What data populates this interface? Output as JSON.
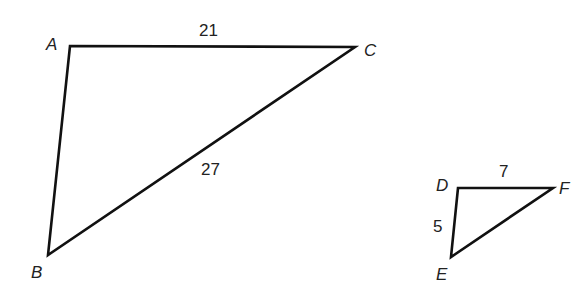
{
  "diagram": {
    "type": "similar-triangles",
    "triangles": [
      {
        "name": "ABC",
        "vertices": [
          {
            "label": "A",
            "x": 70,
            "y": 46,
            "lx": 46,
            "ly": 50
          },
          {
            "label": "B",
            "x": 48,
            "y": 255,
            "lx": 31,
            "ly": 278
          },
          {
            "label": "C",
            "x": 355,
            "y": 47,
            "lx": 364,
            "ly": 56
          }
        ],
        "side_labels": [
          {
            "side": "AC",
            "text": "21",
            "x": 199,
            "y": 36
          },
          {
            "side": "BC",
            "text": "27",
            "x": 201,
            "y": 175
          }
        ]
      },
      {
        "name": "DEF",
        "vertices": [
          {
            "label": "D",
            "x": 458,
            "y": 188,
            "lx": 436,
            "ly": 191
          },
          {
            "label": "E",
            "x": 451,
            "y": 257,
            "lx": 436,
            "ly": 280
          },
          {
            "label": "F",
            "x": 553,
            "y": 188,
            "lx": 559,
            "ly": 194
          }
        ],
        "side_labels": [
          {
            "side": "DF",
            "text": "7",
            "x": 499,
            "y": 177
          },
          {
            "side": "DE",
            "text": "5",
            "x": 433,
            "y": 232
          }
        ]
      }
    ]
  }
}
